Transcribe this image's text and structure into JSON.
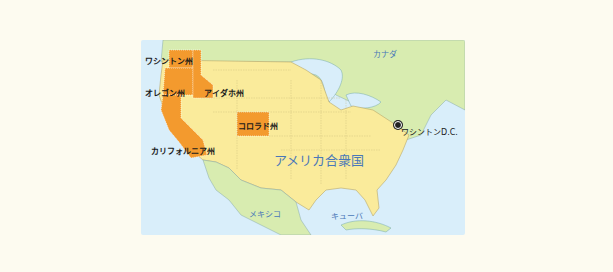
{
  "map": {
    "colors": {
      "background": "#fdfbf0",
      "ocean": "#d9eefa",
      "usa": "#faeb9b",
      "canada_mexico": "#d8ecb0",
      "highlight": "#f39a2e",
      "label_blue": "#4a78b8"
    },
    "labels": {
      "washington": "ワシントン州",
      "oregon": "オレゴン州",
      "idaho": "アイダホ州",
      "colorado": "コロラド州",
      "california": "カリフォルニア州",
      "canada": "カナダ",
      "usa": "アメリカ合衆国",
      "washington_dc": "ワシントンD.C.",
      "mexico": "メキシコ",
      "cuba": "キューバ"
    },
    "highlighted_states": [
      "ワシントン州",
      "オレゴン州",
      "アイダホ州",
      "コロラド州",
      "カリフォルニア州"
    ],
    "marker": {
      "name": "ワシントンD.C.",
      "icon": "capital-dot-icon"
    }
  }
}
